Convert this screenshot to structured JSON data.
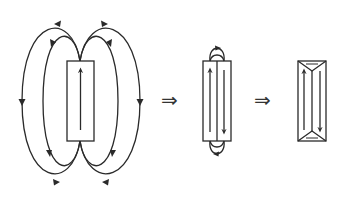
{
  "diagram": {
    "stroke_color": "#2a2a2a",
    "background": "#ffffff",
    "panels": [
      {
        "id": "single-domain",
        "description": "Single-domain magnet with large external stray field loops",
        "magnetization": [
          "up"
        ]
      },
      {
        "id": "two-domain",
        "description": "Two antiparallel domains with small stray field loops at the ends",
        "magnetization": [
          "up",
          "down"
        ]
      },
      {
        "id": "closure-domain",
        "description": "Two antiparallel domains with triangular closure domains, no stray field",
        "magnetization": [
          "up",
          "down"
        ]
      }
    ],
    "implies_symbols": [
      "⇒",
      "⇒"
    ]
  }
}
